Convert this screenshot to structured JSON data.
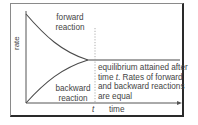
{
  "diagram": {
    "title": "",
    "axes": {
      "y_label": "rate",
      "x_label": "time",
      "x_marker": "t"
    },
    "curves": [
      {
        "name": "forward-reaction",
        "label_line1": "forward",
        "label_line2": "reaction",
        "trend": "decreasing to equilibrium"
      },
      {
        "name": "backward-reaction",
        "label_line1": "backward",
        "label_line2": "reaction",
        "trend": "increasing to equilibrium"
      }
    ],
    "annotation": {
      "line1": "equilibrium attained after",
      "line2_prefix": "time ",
      "line2_italic": "t",
      "line2_suffix": ". Rates of forward",
      "line3": "and backward reactions",
      "line4": "are equal"
    },
    "colors": {
      "curve": "#4a4a4a",
      "axis": "#555555",
      "frame_shadow": "#2a2a2a",
      "dotted": "#9a9a9a"
    }
  }
}
